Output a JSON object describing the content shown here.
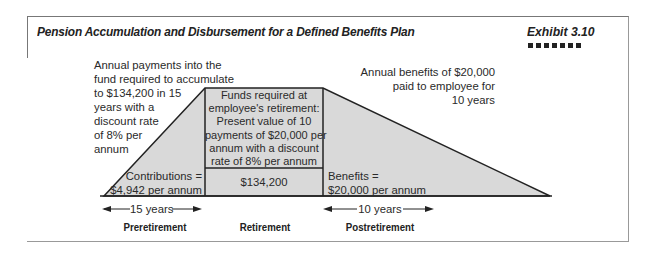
{
  "header": {
    "title": "Pension Accumulation and Disbursement for a Defined Benefits Plan",
    "exhibit": "Exhibit 3.10"
  },
  "diagram": {
    "fill_color": "#d9d9d9",
    "left_note": [
      "Annual payments into the",
      "fund required to accumulate",
      "to $134,200 in 15",
      "years with a",
      "discount rate",
      "of 8% per",
      "annum"
    ],
    "right_note": [
      "Annual benefits of $20,000",
      "paid to employee for",
      "10 years"
    ],
    "center_box": [
      "Funds required at",
      "employee's retirement:",
      "Present value of 10",
      "payments of $20,000 per",
      "annum with a discount",
      "rate of 8% per annum"
    ],
    "center_value": "$134,200",
    "contributions": [
      "Contributions =",
      "$4,942 per annum"
    ],
    "benefits": [
      "Benefits =",
      "$20,000 per annum"
    ],
    "left_duration": "15 years",
    "right_duration": "10 years",
    "phases": [
      "Preretirement",
      "Retirement",
      "Postretirement"
    ]
  }
}
